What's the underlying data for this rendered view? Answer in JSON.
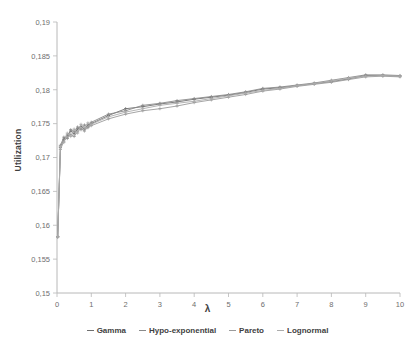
{
  "chart_data": {
    "type": "line",
    "title": "",
    "xlabel": "λ",
    "ylabel": "Utilization",
    "xlim": [
      0,
      10
    ],
    "ylim": [
      0.15,
      0.19
    ],
    "grid": false,
    "legend_position": "bottom",
    "x_ticks": [
      "0",
      "1",
      "2",
      "3",
      "4",
      "5",
      "6",
      "7",
      "8",
      "9",
      "10"
    ],
    "y_ticks": [
      "0,15",
      "0,155",
      "0,16",
      "0,165",
      "0,17",
      "0,175",
      "0,18",
      "0,185",
      "0,19"
    ],
    "decimal_separator": ",",
    "colors": {
      "gamma": "#7f7f7f",
      "hypo_exponential": "#9a9a9a",
      "pareto": "#8d8d8d",
      "lognormal": "#a8a8a8",
      "axis": "#b8b8b8",
      "text": "#6e6e6e"
    },
    "series": [
      {
        "name": "Gamma",
        "color": "#6f6f6f",
        "x": [
          0.02,
          0.1,
          0.2,
          0.3,
          0.4,
          0.5,
          0.6,
          0.7,
          0.8,
          0.9,
          1.0,
          1.5,
          2.0,
          2.5,
          3.0,
          3.5,
          4.0,
          4.5,
          5.0,
          5.5,
          6.0,
          6.5,
          7.0,
          7.5,
          8.0,
          8.5,
          9.0,
          9.5,
          10.0
        ],
        "values": [
          0.1583,
          0.1715,
          0.1727,
          0.1733,
          0.1739,
          0.1735,
          0.1742,
          0.1746,
          0.1742,
          0.1748,
          0.175,
          0.1762,
          0.1772,
          0.1775,
          0.1779,
          0.1782,
          0.1786,
          0.1789,
          0.1792,
          0.1796,
          0.1801,
          0.1803,
          0.1806,
          0.1809,
          0.1812,
          0.1816,
          0.1821,
          0.1821,
          0.182
        ]
      },
      {
        "name": "Hypo-exponential",
        "color": "#8a8a8a",
        "x": [
          0.02,
          0.1,
          0.2,
          0.3,
          0.4,
          0.5,
          0.6,
          0.7,
          0.8,
          0.9,
          1.0,
          1.5,
          2.0,
          2.5,
          3.0,
          3.5,
          4.0,
          4.5,
          5.0,
          5.5,
          6.0,
          6.5,
          7.0,
          7.5,
          8.0,
          8.5,
          9.0,
          9.5,
          10.0
        ],
        "values": [
          0.1583,
          0.1718,
          0.173,
          0.1728,
          0.1741,
          0.1738,
          0.1745,
          0.1741,
          0.1748,
          0.1744,
          0.1752,
          0.1764,
          0.1769,
          0.1777,
          0.178,
          0.1784,
          0.1787,
          0.179,
          0.1793,
          0.1797,
          0.1802,
          0.1804,
          0.1807,
          0.181,
          0.1814,
          0.1818,
          0.1822,
          0.1822,
          0.1821
        ]
      },
      {
        "name": "Pareto",
        "color": "#9b9b9b",
        "x": [
          0.02,
          0.1,
          0.2,
          0.3,
          0.4,
          0.5,
          0.6,
          0.7,
          0.8,
          0.9,
          1.0,
          1.5,
          2.0,
          2.5,
          3.0,
          3.5,
          4.0,
          4.5,
          5.0,
          5.5,
          6.0,
          6.5,
          7.0,
          7.5,
          8.0,
          8.5,
          9.0,
          9.5,
          10.0
        ],
        "values": [
          0.1583,
          0.1712,
          0.1724,
          0.173,
          0.1734,
          0.1731,
          0.1738,
          0.1743,
          0.1739,
          0.1745,
          0.1747,
          0.1757,
          0.1764,
          0.1769,
          0.1772,
          0.1776,
          0.1781,
          0.1785,
          0.1789,
          0.1793,
          0.1798,
          0.1801,
          0.1805,
          0.1808,
          0.1811,
          0.1815,
          0.1819,
          0.182,
          0.1819
        ]
      },
      {
        "name": "Lognormal",
        "color": "#acacac",
        "x": [
          0.02,
          0.1,
          0.2,
          0.3,
          0.4,
          0.5,
          0.6,
          0.7,
          0.8,
          0.9,
          1.0,
          1.5,
          2.0,
          2.5,
          3.0,
          3.5,
          4.0,
          4.5,
          5.0,
          5.5,
          6.0,
          6.5,
          7.0,
          7.5,
          8.0,
          8.5,
          9.0,
          9.5,
          10.0
        ],
        "values": [
          0.1583,
          0.1716,
          0.1722,
          0.1736,
          0.1731,
          0.1742,
          0.1736,
          0.1749,
          0.1744,
          0.1751,
          0.1749,
          0.176,
          0.1767,
          0.1772,
          0.1777,
          0.178,
          0.1783,
          0.1787,
          0.1791,
          0.1795,
          0.1799,
          0.1802,
          0.1806,
          0.1809,
          0.1813,
          0.1817,
          0.182,
          0.1821,
          0.182
        ]
      }
    ]
  },
  "legend": {
    "items": [
      {
        "label": "Gamma"
      },
      {
        "label": "Hypo-exponential"
      },
      {
        "label": "Pareto"
      },
      {
        "label": "Lognormal"
      }
    ]
  },
  "axis_titles": {
    "x": "λ",
    "y": "Utilization"
  }
}
